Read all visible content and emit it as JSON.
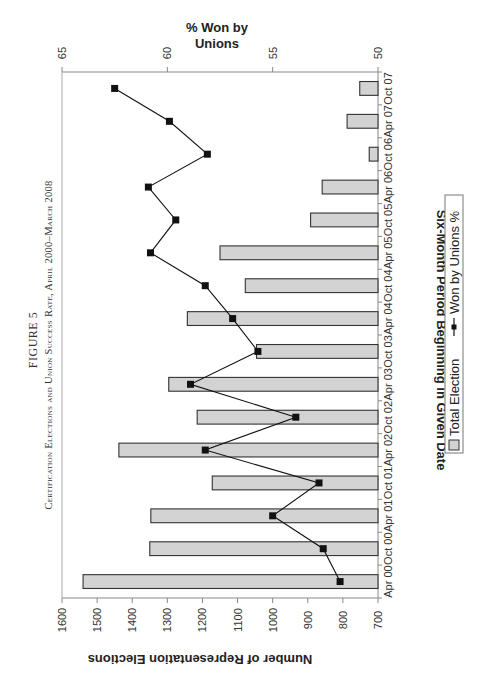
{
  "figure": {
    "label": "FIGURE 5",
    "title": "Certification Elections and Union Success Rate, April 2000–March 2008"
  },
  "chart_data": {
    "type": "bar",
    "orientation": "rotated-90",
    "title": "Certification Elections and Union Success Rate, April 2000–March 2008",
    "xlabel": "Six-Month Period Beginning in Given Date",
    "ylabel": "Number of Representation Elections",
    "y2label": "% Won by Unions",
    "ylim": [
      700,
      1600
    ],
    "y2lim": [
      50,
      65
    ],
    "yticks": [
      "700",
      "800",
      "900",
      "1000",
      "1100",
      "1200",
      "1300",
      "1400",
      "1500",
      "1600"
    ],
    "y2ticks": [
      "50",
      "55",
      "60",
      "65"
    ],
    "categories": [
      "Apr 00",
      "Oct 00",
      "Apr 01",
      "Oct 01",
      "Apr 02",
      "Oct 02",
      "Apr 03",
      "Oct 03",
      "Apr 04",
      "Oct 04",
      "Apr 05",
      "Oct 05",
      "Apr 06",
      "Oct 06",
      "Apr 07",
      "Oct 07"
    ],
    "series": [
      {
        "name": "Total Election",
        "type": "bar",
        "axis": "primary",
        "color": "#d3d3d3",
        "values": [
          1540,
          1350,
          1347,
          1172,
          1438,
          1215,
          1296,
          1046,
          1243,
          1078,
          1150,
          892,
          859,
          725,
          788,
          752
        ]
      },
      {
        "name": "Won by Unions %",
        "type": "line",
        "axis": "secondary",
        "color": "#111111",
        "marker": "square",
        "values": [
          51.8,
          52.6,
          55.0,
          52.8,
          58.2,
          53.9,
          58.9,
          55.7,
          56.9,
          58.2,
          60.8,
          59.6,
          60.9,
          58.1,
          59.9,
          62.5
        ]
      }
    ],
    "legend": {
      "position": "bottom",
      "entries": [
        "Total Election",
        "Won by Unions %"
      ]
    },
    "grid": false
  }
}
